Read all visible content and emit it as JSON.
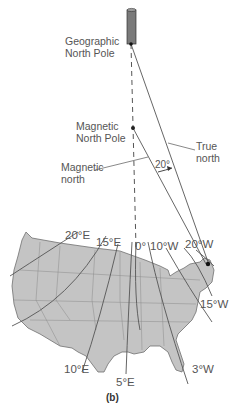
{
  "figure": {
    "caption": "(b)",
    "labels": {
      "geographic_pole_line1": "Geographic",
      "geographic_pole_line2": "North Pole",
      "magnetic_pole_line1": "Magnetic",
      "magnetic_pole_line2": "North Pole",
      "magnetic_north_line1": "Magnetic",
      "magnetic_north_line2": "north",
      "true_north_line1": "True",
      "true_north_line2": "north",
      "angle": "20°"
    },
    "isogonic_lines": [
      {
        "label": "20°E"
      },
      {
        "label": "15°E"
      },
      {
        "label": "0°"
      },
      {
        "label": "10°W"
      },
      {
        "label": "20°W"
      },
      {
        "label": "15°W"
      },
      {
        "label": "3°W"
      },
      {
        "label": "10°E"
      },
      {
        "label": "5°E"
      }
    ],
    "colors": {
      "map_fill": "#c4c4c4",
      "map_stroke": "#707070",
      "line": "#555555",
      "pole_cylinder": "#7a7a7a"
    }
  }
}
